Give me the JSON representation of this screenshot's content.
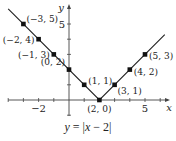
{
  "chart_data": {
    "type": "line",
    "title": "",
    "function": "y = |x - 2|",
    "xlabel": "x",
    "ylabel": "y",
    "xlim": [
      -4,
      6.5
    ],
    "ylim": [
      -1,
      6.2
    ],
    "x_tick_labels": [
      {
        "value": -2,
        "label": "−2"
      },
      {
        "value": 5,
        "label": "5"
      }
    ],
    "y_tick_labels": [
      {
        "value": 5,
        "label": "5"
      }
    ],
    "grid": false,
    "points": [
      {
        "x": -3,
        "y": 5,
        "label": "(−3, 5)"
      },
      {
        "x": -2,
        "y": 4,
        "label": "(−2, 4)"
      },
      {
        "x": -1,
        "y": 3,
        "label": "(−1, 3)"
      },
      {
        "x": 0,
        "y": 2,
        "label": "(0, 2)"
      },
      {
        "x": 1,
        "y": 1,
        "label": "(1, 1)"
      },
      {
        "x": 2,
        "y": 0,
        "label": "(2, 0)"
      },
      {
        "x": 3,
        "y": 1,
        "label": "(3, 1)"
      },
      {
        "x": 4,
        "y": 2,
        "label": "(4, 2)"
      },
      {
        "x": 5,
        "y": 3,
        "label": "(5, 3)"
      }
    ]
  },
  "caption": {
    "y": "y",
    "eq": " = |",
    "x": "x",
    "rest": " − 2|"
  },
  "colors": {
    "line": "#222222",
    "axis": "#444444",
    "point": "#111111"
  }
}
